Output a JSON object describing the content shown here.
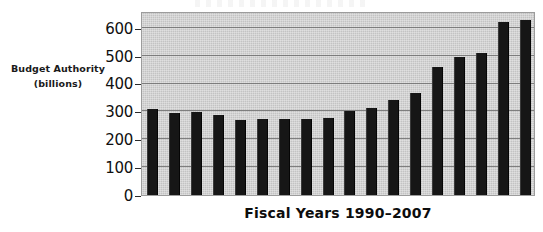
{
  "chart_data": {
    "type": "bar",
    "title": "",
    "xlabel": "Fiscal Years 1990–2007",
    "ylabel": "Budget Authority (billions)",
    "categories": [
      "1990",
      "1991",
      "1992",
      "1993",
      "1994",
      "1995",
      "1996",
      "1997",
      "1998",
      "1999",
      "2000",
      "2001",
      "2002",
      "2003",
      "2004",
      "2005",
      "2006",
      "2007"
    ],
    "values": [
      308,
      293,
      297,
      287,
      268,
      272,
      272,
      273,
      276,
      300,
      311,
      340,
      367,
      460,
      494,
      511,
      622,
      628
    ],
    "ylim": [
      0,
      660
    ],
    "yticks": [
      0,
      100,
      200,
      300,
      400,
      500,
      600
    ],
    "ytick_labels": [
      "0",
      "100",
      "200",
      "300",
      "400",
      "500",
      "600"
    ],
    "grid": true,
    "legend": false,
    "bar_color": "#161616",
    "plot_background": "#c3c3c3",
    "gridline_color": "#6f6f6f"
  },
  "axis_label": {
    "line1": "Budget Authority",
    "line2": "(billions)"
  },
  "x_axis": {
    "title": "Fiscal Years 1990–2007"
  }
}
